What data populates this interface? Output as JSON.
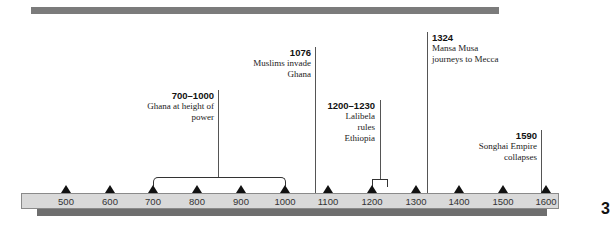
{
  "timeline": {
    "axis_ticks": [
      "500",
      "600",
      "700",
      "800",
      "900",
      "1000",
      "1100",
      "1200",
      "1300",
      "1400",
      "1500",
      "1600"
    ],
    "events": [
      {
        "year": "700–1000",
        "description": "Ghana at height of\npower"
      },
      {
        "year": "1076",
        "description": "Muslims invade\nGhana"
      },
      {
        "year": "1200–1230",
        "description": "Lalibela\nrules\nEthiopia"
      },
      {
        "year": "1324",
        "description": "Mansa Musa\njourneys to Mecca"
      },
      {
        "year": "1590",
        "description": "Songhai Empire\ncollapses"
      }
    ],
    "edge_glyph": "3"
  }
}
